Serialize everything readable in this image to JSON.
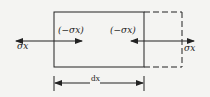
{
  "diagram": {
    "labels": {
      "left_outer": "σx",
      "left_inner": "(−σx)",
      "right_inner": "(−σx)",
      "right_outer": "σx",
      "dimension": "dx"
    },
    "colors": {
      "background": "#f4f4f2",
      "stroke": "#222222"
    }
  }
}
